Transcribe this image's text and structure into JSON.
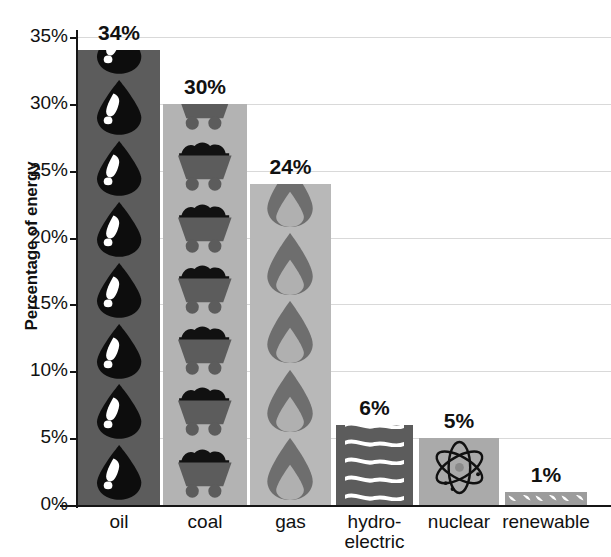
{
  "chart_data": {
    "type": "bar",
    "title": "",
    "xlabel": "",
    "ylabel": "Percentage of energy",
    "categories": [
      "oil",
      "coal",
      "gas",
      "hydro-electric",
      "nuclear",
      "renewable"
    ],
    "values": [
      34,
      30,
      24,
      6,
      5,
      1
    ],
    "data_labels": [
      "34%",
      "30%",
      "24%",
      "6%",
      "5%",
      "1%"
    ],
    "ylim": [
      0,
      35
    ],
    "ytick_values": [
      0,
      5,
      10,
      15,
      20,
      25,
      30,
      35
    ],
    "ytick_labels": [
      "0%",
      "5%",
      "10%",
      "15%",
      "20%",
      "25%",
      "30%",
      "35%"
    ],
    "grid": true,
    "legend": "none",
    "series": [
      {
        "name": "Percentage of energy",
        "values": [
          34,
          30,
          24,
          6,
          5,
          1
        ]
      }
    ],
    "bars": [
      {
        "category": "oil",
        "label_lines": [
          "oil"
        ],
        "value": 34,
        "data_label": "34%",
        "icon": "oil-drop-icon",
        "bar_color": "#5c5c5c",
        "icon_color": "#0d0d0d",
        "icon_accent_color": "#ffffff",
        "icon_count": 8
      },
      {
        "category": "coal",
        "label_lines": [
          "coal"
        ],
        "value": 30,
        "data_label": "30%",
        "icon": "coal-cart-icon",
        "bar_color": "#b3b3b3",
        "icon_color": "#5c5c5c",
        "icon_accent_color": "#111111",
        "icon_count": 7
      },
      {
        "category": "gas",
        "label_lines": [
          "gas"
        ],
        "value": 24,
        "data_label": "24%",
        "icon": "gas-flame-icon",
        "bar_color": "#b8b8b8",
        "icon_color": "#6e6e6e",
        "icon_accent_color": "#b0b0b0",
        "icon_count": 5
      },
      {
        "category": "hydro-electric",
        "label_lines": [
          "hydro-",
          "electric"
        ],
        "value": 6,
        "data_label": "6%",
        "icon": "water-wave-icon",
        "bar_color": "#5c5c5c",
        "icon_color": "#ffffff",
        "icon_accent_color": "#ffffff",
        "icon_count": 7
      },
      {
        "category": "nuclear",
        "label_lines": [
          "nuclear"
        ],
        "value": 5,
        "data_label": "5%",
        "icon": "atom-icon",
        "bar_color": "#aaaaaa",
        "icon_color": "#111111",
        "icon_accent_color": "#8a8a8a",
        "icon_count": 1
      },
      {
        "category": "renewable",
        "label_lines": [
          "renewable"
        ],
        "value": 1,
        "data_label": "1%",
        "icon": "wind-leaf-icon",
        "bar_color": "#9c9c9c",
        "icon_color": "#ffffff",
        "icon_accent_color": "#ffffff",
        "icon_count": 6
      }
    ]
  },
  "colors": {
    "axis": "#151515",
    "grid": "#d9d9d9",
    "text": "#111111",
    "background": "#ffffff"
  }
}
